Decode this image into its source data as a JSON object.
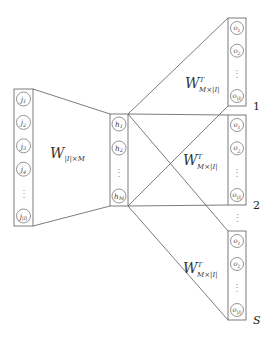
{
  "diagram": {
    "input_layer": {
      "nodes": [
        "j1",
        "j2",
        "j3",
        "j4",
        "⋮",
        "j|I|"
      ],
      "node_display": [
        {
          "base": "j",
          "sub": "1"
        },
        {
          "base": "j",
          "sub": "2"
        },
        {
          "base": "j",
          "sub": "3"
        },
        {
          "base": "j",
          "sub": "4"
        },
        {
          "ellipsis": true
        },
        {
          "base": "j",
          "sub": "|I|"
        }
      ]
    },
    "input_weight": {
      "main": "W",
      "sup": "",
      "sub": "|I|×M"
    },
    "hidden_layer": {
      "node_display": [
        {
          "base": "h",
          "sub": "1"
        },
        {
          "base": "h",
          "sub": "2"
        },
        {
          "ellipsis": true
        },
        {
          "base": "h",
          "sub": "M"
        }
      ]
    },
    "output_weight": {
      "main": "W",
      "sup": "T",
      "sub": "M×|I|"
    },
    "output_blocks": [
      {
        "label": "1",
        "label_italic": false,
        "node_display": [
          {
            "base": "o",
            "sub": "1"
          },
          {
            "base": "o",
            "sub": "2"
          },
          {
            "ellipsis": true
          },
          {
            "base": "o",
            "sub": "|I|"
          }
        ]
      },
      {
        "label": "2",
        "label_italic": false,
        "node_display": [
          {
            "base": "o",
            "sub": "1"
          },
          {
            "base": "o",
            "sub": "2"
          },
          {
            "ellipsis": true
          },
          {
            "base": "o",
            "sub": "|I|"
          }
        ]
      },
      {
        "label": "S",
        "label_italic": true,
        "node_display": [
          {
            "base": "o",
            "sub": "1"
          },
          {
            "base": "o",
            "sub": "2"
          },
          {
            "ellipsis": true
          },
          {
            "base": "o",
            "sub": "|I|"
          }
        ]
      }
    ],
    "between_blocks_ellipsis": "⋮"
  }
}
